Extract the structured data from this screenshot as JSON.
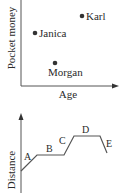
{
  "scatter": {
    "y_axis_label": "Pocket money",
    "x_axis_label": "Age",
    "points": [
      {
        "name": "Karl",
        "cx": 82,
        "cy": 16
      },
      {
        "name": "Janica",
        "cx": 35,
        "cy": 33
      },
      {
        "name": "Morgan",
        "cx": 55,
        "cy": 63
      }
    ]
  },
  "distance_graph": {
    "y_axis_label": "Distance",
    "segments": [
      {
        "label": "A"
      },
      {
        "label": "B"
      },
      {
        "label": "C"
      },
      {
        "label": "D"
      },
      {
        "label": "E"
      }
    ]
  },
  "colors": {
    "ink": "#2a2a2a",
    "line": "#555555"
  }
}
